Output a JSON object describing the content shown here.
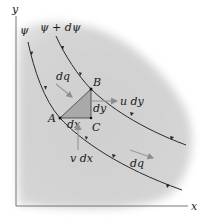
{
  "diagram": {
    "axes": {
      "x_label": "x",
      "y_label": "y"
    },
    "streamlines": [
      {
        "label": "ψ"
      },
      {
        "label": "ψ + dψ"
      }
    ],
    "points": {
      "A": "A",
      "B": "B",
      "C": "C"
    },
    "segments": {
      "horizontal": "dx",
      "vertical": "dy"
    },
    "flow_labels": {
      "dq_upper": "dq",
      "dq_lower": "dq",
      "u_dy": "u dy",
      "v_dx": "v dx"
    },
    "colors": {
      "background_region": "#d2d2d2",
      "triangle_fill": "#a9a9a9",
      "arrow_gray": "#9a9a9a",
      "line_dark": "#2a2a2a"
    }
  }
}
